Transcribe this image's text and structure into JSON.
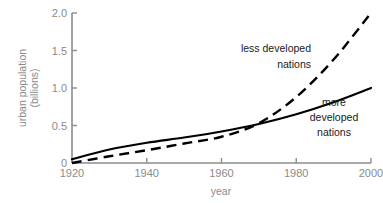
{
  "chart_data": {
    "type": "line",
    "title": "",
    "xlabel": "year",
    "ylabel": "urban population (billions)",
    "ylabel_line1": "urban population",
    "ylabel_line2": "(billions)",
    "xlim": [
      1920,
      2000
    ],
    "ylim": [
      0,
      2.0
    ],
    "grid": false,
    "legend_position": "inline-annotation",
    "xticks": [
      1920,
      1940,
      1960,
      1980,
      2000
    ],
    "xtick_labels": [
      "1920",
      "1940",
      "1960",
      "1980",
      "2000"
    ],
    "yticks": [
      0,
      0.5,
      1.0,
      1.5,
      2.0
    ],
    "ytick_labels": [
      "0",
      "0.5",
      "1.0",
      "1.5",
      "2.0"
    ],
    "x": [
      1920,
      1930,
      1940,
      1950,
      1960,
      1970,
      1980,
      1990,
      2000
    ],
    "series": [
      {
        "name": "more developed nations",
        "style": "solid",
        "color": "#000000",
        "values": [
          0.05,
          0.18,
          0.27,
          0.34,
          0.42,
          0.52,
          0.65,
          0.81,
          1.0
        ],
        "annotation_lines": [
          "more",
          "developed",
          "nations"
        ],
        "annotation_align": "center"
      },
      {
        "name": "less developed nations",
        "style": "dashed",
        "color": "#000000",
        "values": [
          0.0,
          0.09,
          0.17,
          0.26,
          0.35,
          0.53,
          0.88,
          1.38,
          2.0
        ],
        "annotation_lines": [
          "less developed",
          "nations"
        ],
        "annotation_align": "right"
      }
    ],
    "crossing_point": {
      "x": 1970,
      "y": 0.52
    },
    "colors": {
      "background": "#ffffff",
      "axis": "#8c8c8c",
      "tick_text": "#8a8a8a",
      "curve": "#000000",
      "annotation_text": "#1a1a1a"
    }
  }
}
